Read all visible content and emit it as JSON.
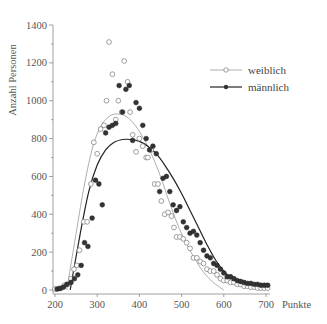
{
  "chart_data": {
    "type": "scatter",
    "title": "",
    "xlabel": "Punkte",
    "ylabel": "Anzahl Personen",
    "xlim": [
      200,
      700
    ],
    "ylim": [
      0,
      1400
    ],
    "xticks": [
      200,
      300,
      400,
      500,
      600,
      700
    ],
    "yticks": [
      0,
      200,
      400,
      600,
      800,
      1000,
      1200,
      1400
    ],
    "xtick_labels": [
      "200",
      "300",
      "400",
      "500",
      "600",
      "700"
    ],
    "ytick_labels": [
      "0",
      "200",
      "400",
      "600",
      "800",
      "1000",
      "1200",
      "1400"
    ],
    "grid": false,
    "legend_position": "top-right",
    "series": [
      {
        "name": "weiblich",
        "marker": "open-circle",
        "color": "#888888",
        "points": [
          [
            200,
            5
          ],
          [
            208,
            8
          ],
          [
            215,
            10
          ],
          [
            222,
            25
          ],
          [
            230,
            30
          ],
          [
            238,
            60
          ],
          [
            245,
            110
          ],
          [
            252,
            130
          ],
          [
            258,
            210
          ],
          [
            268,
            360
          ],
          [
            276,
            360
          ],
          [
            285,
            560
          ],
          [
            292,
            780
          ],
          [
            300,
            720
          ],
          [
            308,
            850
          ],
          [
            316,
            870
          ],
          [
            322,
            1000
          ],
          [
            328,
            1310
          ],
          [
            336,
            1140
          ],
          [
            344,
            900
          ],
          [
            350,
            1000
          ],
          [
            358,
            940
          ],
          [
            364,
            1210
          ],
          [
            372,
            1100
          ],
          [
            378,
            940
          ],
          [
            384,
            820
          ],
          [
            392,
            730
          ],
          [
            400,
            800
          ],
          [
            408,
            760
          ],
          [
            416,
            700
          ],
          [
            420,
            700
          ],
          [
            428,
            740
          ],
          [
            436,
            560
          ],
          [
            444,
            560
          ],
          [
            452,
            470
          ],
          [
            460,
            400
          ],
          [
            468,
            410
          ],
          [
            476,
            390
          ],
          [
            482,
            330
          ],
          [
            488,
            280
          ],
          [
            496,
            280
          ],
          [
            504,
            270
          ],
          [
            512,
            250
          ],
          [
            520,
            220
          ],
          [
            528,
            170
          ],
          [
            536,
            170
          ],
          [
            544,
            150
          ],
          [
            552,
            140
          ],
          [
            560,
            110
          ],
          [
            568,
            100
          ],
          [
            576,
            100
          ],
          [
            584,
            80
          ],
          [
            592,
            60
          ],
          [
            600,
            50
          ],
          [
            608,
            50
          ],
          [
            616,
            40
          ],
          [
            624,
            40
          ],
          [
            632,
            30
          ],
          [
            640,
            30
          ],
          [
            648,
            20
          ],
          [
            656,
            20
          ],
          [
            664,
            15
          ],
          [
            672,
            15
          ],
          [
            680,
            10
          ],
          [
            688,
            10
          ],
          [
            696,
            10
          ],
          [
            704,
            10
          ]
        ],
        "fit_curve": [
          [
            228,
            0
          ],
          [
            250,
            300
          ],
          [
            270,
            560
          ],
          [
            290,
            760
          ],
          [
            310,
            870
          ],
          [
            330,
            920
          ],
          [
            350,
            930
          ],
          [
            370,
            915
          ],
          [
            390,
            870
          ],
          [
            410,
            800
          ],
          [
            430,
            710
          ],
          [
            450,
            600
          ],
          [
            470,
            470
          ],
          [
            490,
            350
          ],
          [
            510,
            250
          ],
          [
            530,
            170
          ],
          [
            550,
            100
          ],
          [
            570,
            50
          ],
          [
            590,
            15
          ],
          [
            600,
            0
          ]
        ]
      },
      {
        "name": "männlich",
        "marker": "filled-circle",
        "color": "#333333",
        "points": [
          [
            205,
            5
          ],
          [
            212,
            8
          ],
          [
            220,
            15
          ],
          [
            228,
            30
          ],
          [
            238,
            40
          ],
          [
            246,
            60
          ],
          [
            254,
            80
          ],
          [
            262,
            130
          ],
          [
            270,
            250
          ],
          [
            278,
            230
          ],
          [
            288,
            380
          ],
          [
            296,
            580
          ],
          [
            304,
            560
          ],
          [
            312,
            450
          ],
          [
            320,
            830
          ],
          [
            328,
            860
          ],
          [
            336,
            870
          ],
          [
            344,
            880
          ],
          [
            352,
            1080
          ],
          [
            360,
            940
          ],
          [
            368,
            1060
          ],
          [
            376,
            1080
          ],
          [
            384,
            790
          ],
          [
            392,
            990
          ],
          [
            400,
            960
          ],
          [
            408,
            870
          ],
          [
            416,
            800
          ],
          [
            424,
            740
          ],
          [
            432,
            760
          ],
          [
            440,
            720
          ],
          [
            448,
            520
          ],
          [
            456,
            590
          ],
          [
            464,
            600
          ],
          [
            472,
            520
          ],
          [
            480,
            450
          ],
          [
            488,
            420
          ],
          [
            496,
            440
          ],
          [
            504,
            360
          ],
          [
            512,
            330
          ],
          [
            520,
            300
          ],
          [
            528,
            310
          ],
          [
            536,
            290
          ],
          [
            544,
            250
          ],
          [
            552,
            210
          ],
          [
            560,
            180
          ],
          [
            568,
            170
          ],
          [
            576,
            140
          ],
          [
            584,
            130
          ],
          [
            592,
            110
          ],
          [
            600,
            90
          ],
          [
            608,
            70
          ],
          [
            616,
            70
          ],
          [
            624,
            60
          ],
          [
            632,
            50
          ],
          [
            640,
            45
          ],
          [
            648,
            40
          ],
          [
            656,
            35
          ],
          [
            664,
            35
          ],
          [
            672,
            30
          ],
          [
            680,
            30
          ],
          [
            688,
            25
          ],
          [
            696,
            25
          ],
          [
            704,
            25
          ]
        ],
        "fit_curve": [
          [
            236,
            0
          ],
          [
            260,
            300
          ],
          [
            280,
            520
          ],
          [
            300,
            660
          ],
          [
            320,
            740
          ],
          [
            340,
            780
          ],
          [
            360,
            795
          ],
          [
            380,
            795
          ],
          [
            400,
            785
          ],
          [
            420,
            760
          ],
          [
            440,
            720
          ],
          [
            460,
            660
          ],
          [
            480,
            590
          ],
          [
            500,
            510
          ],
          [
            520,
            420
          ],
          [
            540,
            330
          ],
          [
            560,
            240
          ],
          [
            580,
            160
          ],
          [
            600,
            100
          ],
          [
            620,
            60
          ],
          [
            640,
            35
          ],
          [
            660,
            25
          ],
          [
            680,
            20
          ],
          [
            700,
            20
          ]
        ]
      }
    ]
  }
}
